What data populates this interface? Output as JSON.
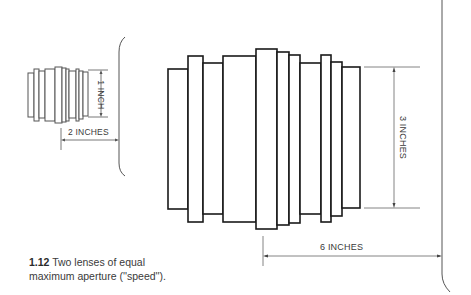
{
  "figure": {
    "number": "1.12",
    "caption": "Two lenses of equal",
    "caption_line2": "maximum aperture (''speed'')."
  },
  "small_lens": {
    "height_label": "1 INCH",
    "length_label": "2 INCHES"
  },
  "large_lens": {
    "height_label": "3 INCHES",
    "length_label": "6 INCHES"
  },
  "colors": {
    "line": "#1a1a1a",
    "dim_line": "#555555",
    "text": "#3a3a3a",
    "background": "#ffffff"
  }
}
